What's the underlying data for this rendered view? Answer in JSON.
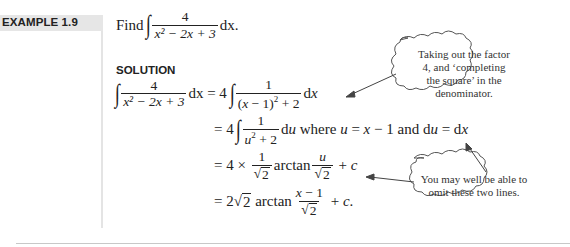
{
  "example": {
    "label": "EXAMPLE 1.9",
    "prompt_word": "Find",
    "integral": {
      "numerator": "4",
      "denominator": "x² − 2x + 3",
      "differential": "dx."
    }
  },
  "solution": {
    "heading": "SOLUTION",
    "lines": [
      {
        "lhs_num": "4",
        "lhs_den": "x² − 2x + 3",
        "lhs_diff": "dx",
        "rhs": "= 4 ∫ 1/((x − 1)² + 2) dx"
      },
      {
        "rhs": "= 4 ∫ 1/(u² + 2) du where u = x − 1 and du = dx"
      },
      {
        "rhs": "= 4 × 1/√2 arctan u/√2 + c"
      },
      {
        "rhs": "= 2√2 arctan (x − 1)/√2 + c."
      }
    ],
    "where_text": "where",
    "and_text": "and",
    "arctan": "arctan"
  },
  "annotations": [
    {
      "text": "Taking out the factor 4, and ‘completing the square’ in the denominator.",
      "lines": [
        "Taking out the factor",
        "4, and ‘completing",
        "the square’ in the",
        "denominator."
      ]
    },
    {
      "text": "You may well be able to omit these two lines.",
      "lines": [
        "You may well be able to",
        "omit these two lines."
      ]
    }
  ]
}
